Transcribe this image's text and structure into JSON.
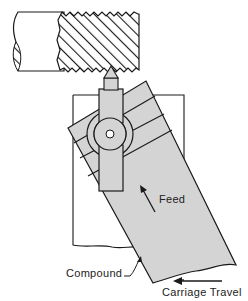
{
  "diagram": {
    "type": "technical-illustration",
    "labels": {
      "feed": "Feed",
      "compound": "Compound",
      "carriage_travel": "Carriage Travel"
    },
    "colors": {
      "line": "#1a1a1a",
      "fill_gray": "#d4d4d4",
      "background": "#ffffff"
    }
  }
}
